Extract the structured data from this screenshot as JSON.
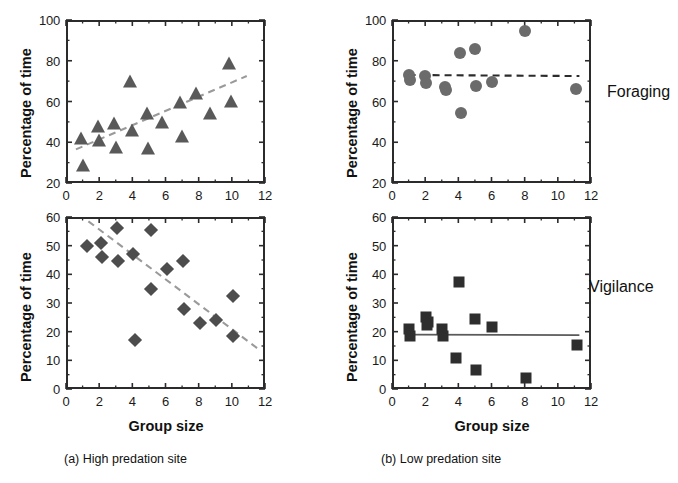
{
  "figure": {
    "captions": [
      {
        "id": "caption-a",
        "text": "(a) High predation site"
      },
      {
        "id": "caption-b",
        "text": "(b) Low predation site"
      }
    ],
    "row_labels": [
      {
        "id": "row-label-foraging",
        "text": "Foraging"
      },
      {
        "id": "row-label-vigilance",
        "text": "Vigilance"
      }
    ],
    "axis_titles": {
      "y": "Percentage of time",
      "x": "Group size"
    }
  },
  "chart_data": [
    {
      "id": "panel-a-foraging",
      "type": "scatter",
      "title": "(a) High predation site — Foraging",
      "xlabel": "Group size",
      "ylabel": "Percentage of time",
      "xlim": [
        0,
        12
      ],
      "ylim": [
        20,
        100
      ],
      "xticks": [
        0,
        2,
        4,
        6,
        8,
        10,
        12
      ],
      "yticks": [
        20,
        40,
        60,
        80,
        100
      ],
      "minor_ticks": true,
      "grid": false,
      "legend": "none",
      "marker": "triangle",
      "marker_color": "#595959",
      "points": [
        {
          "x": 0.9,
          "y": 43
        },
        {
          "x": 1.0,
          "y": 30
        },
        {
          "x": 1.9,
          "y": 49
        },
        {
          "x": 2.0,
          "y": 42
        },
        {
          "x": 2.9,
          "y": 50.5
        },
        {
          "x": 3.0,
          "y": 38.5
        },
        {
          "x": 3.85,
          "y": 71
        },
        {
          "x": 3.95,
          "y": 47
        },
        {
          "x": 4.9,
          "y": 55.5
        },
        {
          "x": 4.95,
          "y": 38
        },
        {
          "x": 5.8,
          "y": 51
        },
        {
          "x": 6.9,
          "y": 60.5
        },
        {
          "x": 7.0,
          "y": 44
        },
        {
          "x": 7.85,
          "y": 65
        },
        {
          "x": 8.7,
          "y": 55.5
        },
        {
          "x": 9.85,
          "y": 80
        },
        {
          "x": 9.95,
          "y": 61
        }
      ],
      "trendline": {
        "style": "dashed",
        "color": "#9a9a9a",
        "x0": 0.6,
        "y0": 36.5,
        "x1": 10.9,
        "y1": 72.5
      }
    },
    {
      "id": "panel-a-vigilance",
      "type": "scatter",
      "title": "(a) High predation site — Vigilance",
      "xlabel": "Group size",
      "ylabel": "Percentage of time",
      "xlim": [
        0,
        12
      ],
      "ylim": [
        0,
        60
      ],
      "xticks": [
        0,
        2,
        4,
        6,
        8,
        10,
        12
      ],
      "yticks": [
        0,
        10,
        20,
        30,
        40,
        50,
        60
      ],
      "minor_ticks": true,
      "grid": false,
      "legend": "none",
      "marker": "diamond",
      "marker_color": "#4d4d4d",
      "points": [
        {
          "x": 1.25,
          "y": 50
        },
        {
          "x": 2.1,
          "y": 51
        },
        {
          "x": 2.2,
          "y": 46
        },
        {
          "x": 3.05,
          "y": 56
        },
        {
          "x": 3.15,
          "y": 44.5
        },
        {
          "x": 4.05,
          "y": 47
        },
        {
          "x": 4.15,
          "y": 17
        },
        {
          "x": 5.1,
          "y": 55.5
        },
        {
          "x": 5.15,
          "y": 35
        },
        {
          "x": 6.1,
          "y": 42
        },
        {
          "x": 7.05,
          "y": 44.5
        },
        {
          "x": 7.1,
          "y": 28
        },
        {
          "x": 8.1,
          "y": 23
        },
        {
          "x": 9.05,
          "y": 24
        },
        {
          "x": 10.05,
          "y": 32.5
        },
        {
          "x": 10.1,
          "y": 18.5
        }
      ],
      "trendline": {
        "style": "dashed",
        "color": "#9a9a9a",
        "x0": 1.35,
        "y0": 58.5,
        "x1": 11.7,
        "y1": 13.5
      }
    },
    {
      "id": "panel-b-foraging",
      "type": "scatter",
      "title": "(b) Low predation site — Foraging",
      "xlabel": "Group size",
      "ylabel": "Percentage of time",
      "xlim": [
        0,
        12
      ],
      "ylim": [
        20,
        100
      ],
      "xticks": [
        0,
        2,
        4,
        6,
        8,
        10,
        12
      ],
      "yticks": [
        20,
        40,
        60,
        80,
        100
      ],
      "minor_ticks": true,
      "grid": false,
      "legend": "none",
      "marker": "circle",
      "marker_color": "#6b6b6b",
      "points": [
        {
          "x": 1.05,
          "y": 73
        },
        {
          "x": 1.1,
          "y": 70.5
        },
        {
          "x": 2.0,
          "y": 72.5
        },
        {
          "x": 2.05,
          "y": 69
        },
        {
          "x": 3.2,
          "y": 67
        },
        {
          "x": 3.25,
          "y": 65.5
        },
        {
          "x": 4.1,
          "y": 84
        },
        {
          "x": 4.15,
          "y": 54.5
        },
        {
          "x": 5.0,
          "y": 86
        },
        {
          "x": 5.05,
          "y": 67.5
        },
        {
          "x": 6.0,
          "y": 69.5
        },
        {
          "x": 8.05,
          "y": 94.5
        },
        {
          "x": 11.1,
          "y": 66
        }
      ],
      "trendline": {
        "style": "dashed",
        "color": "#2b2b2b",
        "x0": 1.0,
        "y0": 73,
        "x1": 11.3,
        "y1": 72.5
      }
    },
    {
      "id": "panel-b-vigilance",
      "type": "scatter",
      "title": "(b) Low predation site — Vigilance",
      "xlabel": "Group size",
      "ylabel": "Percentage of time",
      "xlim": [
        0,
        12
      ],
      "ylim": [
        0,
        60
      ],
      "xticks": [
        0,
        2,
        4,
        6,
        8,
        10,
        12
      ],
      "yticks": [
        0,
        10,
        20,
        30,
        40,
        50,
        60
      ],
      "minor_ticks": true,
      "grid": false,
      "legend": "none",
      "marker": "square",
      "marker_color": "#2e2e2e",
      "points": [
        {
          "x": 1.05,
          "y": 21
        },
        {
          "x": 1.1,
          "y": 18.5
        },
        {
          "x": 2.05,
          "y": 25
        },
        {
          "x": 2.1,
          "y": 22.5
        },
        {
          "x": 2.15,
          "y": 23.5
        },
        {
          "x": 3.0,
          "y": 21
        },
        {
          "x": 3.05,
          "y": 18.5
        },
        {
          "x": 3.85,
          "y": 10.8
        },
        {
          "x": 4.05,
          "y": 37.5
        },
        {
          "x": 5.0,
          "y": 24.5
        },
        {
          "x": 5.05,
          "y": 6.5
        },
        {
          "x": 6.05,
          "y": 21.5
        },
        {
          "x": 8.1,
          "y": 4
        },
        {
          "x": 11.15,
          "y": 15.5
        }
      ],
      "trendline": {
        "style": "solid",
        "color": "#5a5a5a",
        "x0": 1.0,
        "y0": 19,
        "x1": 11.3,
        "y1": 18.8
      }
    }
  ]
}
